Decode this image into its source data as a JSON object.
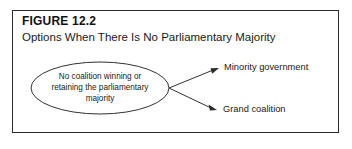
{
  "figure": {
    "number_label": "FIGURE 12.2",
    "subtitle": "Options When There Is No Parliamentary Majority",
    "border_color": "#2b2b2b",
    "background_color": "#ffffff",
    "text_color": "#1a1a1a"
  },
  "diagram": {
    "type": "flow",
    "source_node": {
      "shape": "ellipse",
      "lines": [
        "No coalition winning or",
        "retaining the parliamentary",
        "majority"
      ],
      "full_text": "No coalition winning or retaining the parliamentary majority",
      "center_x": 100,
      "center_y": 88,
      "radius_x": 69,
      "radius_y": 26,
      "stroke_color": "#333333"
    },
    "branches": [
      {
        "label": "Minority government",
        "arrow_from_x": 169,
        "arrow_from_y": 88,
        "arrow_to_x": 219,
        "arrow_to_y": 68
      },
      {
        "label": "Grand coalition",
        "arrow_from_x": 169,
        "arrow_from_y": 88,
        "arrow_to_x": 217,
        "arrow_to_y": 110
      }
    ]
  }
}
